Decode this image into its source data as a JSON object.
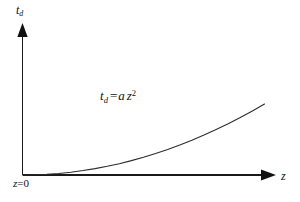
{
  "figure": {
    "background_color": "#ffffff",
    "line_color": "#1a1a1a",
    "curve_color": "#2b2b2b",
    "axes": {
      "y_axis": {
        "label_var": "t",
        "label_sub": "d",
        "label_plain": "td"
      },
      "x_axis": {
        "label_var": "z",
        "label_plain": "z"
      },
      "origin": {
        "label_var": "z",
        "label_rest": "=0",
        "label_plain": "z=0"
      }
    },
    "annotation": {
      "lhs_var": "t",
      "lhs_sub": "d",
      "equals": "=",
      "coefficient": "a",
      "variable": "z",
      "exponent": "2",
      "plain": "td = a z2"
    }
  },
  "chart_data": {
    "type": "line",
    "title": "",
    "subtitle": "",
    "xlabel": "z",
    "ylabel": "td",
    "grid": false,
    "legend": null,
    "annotations": [
      {
        "text": "td = a z^2",
        "x_px": 100,
        "y_px": 89
      },
      {
        "text": "z=0",
        "x_px": 13,
        "y_px": 178
      }
    ],
    "axis_style": {
      "arrow_tipped": true,
      "ticks": false,
      "tick_labels": false,
      "spines": [
        "left",
        "bottom"
      ]
    },
    "xlim": [
      0,
      1
    ],
    "ylim": [
      0,
      1
    ],
    "series": [
      {
        "name": "td = a z^2",
        "equation": "td = a * z^2",
        "a": 1,
        "x": [
          0,
          0.05,
          0.1,
          0.15,
          0.2,
          0.25,
          0.3,
          0.35,
          0.4,
          0.45,
          0.5,
          0.55,
          0.6,
          0.65,
          0.7,
          0.75,
          0.8,
          0.85,
          0.9,
          0.95,
          1.0
        ],
        "y": [
          0,
          0.0025,
          0.01,
          0.0225,
          0.04,
          0.0625,
          0.09,
          0.1225,
          0.16,
          0.2025,
          0.25,
          0.3025,
          0.36,
          0.4225,
          0.49,
          0.5625,
          0.64,
          0.7225,
          0.81,
          0.9025,
          1.0
        ]
      }
    ]
  }
}
